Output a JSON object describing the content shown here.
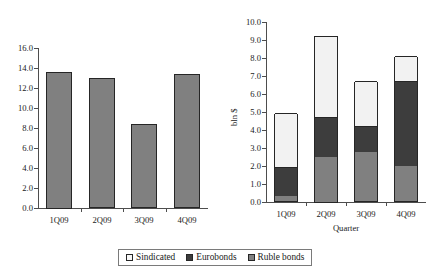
{
  "chart_data": [
    {
      "type": "bar",
      "id": "left-chart",
      "title": "",
      "xlabel": "",
      "ylabel": "",
      "categories": [
        "1Q09",
        "2Q09",
        "3Q09",
        "4Q09"
      ],
      "values": [
        13.65,
        13.0,
        8.4,
        13.4
      ],
      "ylim": [
        0.0,
        16.0
      ],
      "ystep": 2.0,
      "ytick_labels": [
        "16.0",
        "14.0",
        "12.0",
        "10.0",
        "8.0",
        "6.0",
        "4.0",
        "2.0",
        "0.0"
      ],
      "grid": false,
      "series_color": "#808080",
      "border_color": "#262626"
    },
    {
      "type": "bar",
      "id": "right-chart",
      "subtype": "stacked",
      "title": "",
      "xlabel": "Quarter",
      "ylabel": "bln $",
      "categories": [
        "1Q09",
        "2Q09",
        "3Q09",
        "4Q09"
      ],
      "ylim": [
        0.0,
        10.0
      ],
      "ystep": 1.0,
      "ytick_labels": [
        "10.0",
        "9.0",
        "8.0",
        "7.0",
        "6.0",
        "5.0",
        "4.0",
        "3.0",
        "2.0",
        "1.0",
        "0.0"
      ],
      "grid": false,
      "legend_position": "bottom",
      "series": [
        {
          "name": "Ruble bonds",
          "color": "#808080",
          "values": [
            0.3,
            2.5,
            2.7,
            1.95
          ]
        },
        {
          "name": "Eurobonds",
          "color": "#3d3d3d",
          "values": [
            1.6,
            2.25,
            1.45,
            4.7
          ]
        },
        {
          "name": "Sindicated",
          "color": "#f2f2f2",
          "values": [
            3.0,
            4.5,
            2.5,
            1.4
          ]
        }
      ],
      "totals": [
        4.9,
        9.25,
        6.65,
        8.05
      ]
    }
  ],
  "legend": {
    "items": [
      {
        "label": "Sindicated",
        "color": "#f7f7f7"
      },
      {
        "label": "Eurobonds",
        "color": "#3d3d3d"
      },
      {
        "label": "Ruble bonds",
        "color": "#808080"
      }
    ]
  }
}
